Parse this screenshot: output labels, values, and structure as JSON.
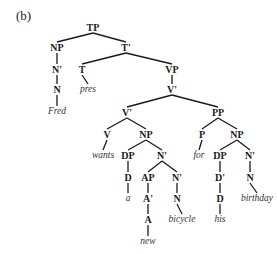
{
  "figure": {
    "panel_label": "(b)"
  },
  "tree": {
    "nodes": [
      {
        "id": "TP",
        "label": "TP",
        "type": "cat",
        "x": 93,
        "y": 28
      },
      {
        "id": "NP1",
        "label": "NP",
        "type": "cat",
        "x": 57,
        "y": 48
      },
      {
        "id": "Tbar",
        "label": "T'",
        "type": "cat",
        "x": 126,
        "y": 48
      },
      {
        "id": "Nbar1",
        "label": "N'",
        "type": "cat",
        "x": 57,
        "y": 70
      },
      {
        "id": "T",
        "label": "T",
        "type": "cat",
        "x": 82,
        "y": 70
      },
      {
        "id": "VP",
        "label": "VP",
        "type": "cat",
        "x": 172,
        "y": 70
      },
      {
        "id": "N1",
        "label": "N",
        "type": "cat",
        "x": 57,
        "y": 90
      },
      {
        "id": "pres",
        "label": "pres",
        "type": "word",
        "x": 88,
        "y": 90
      },
      {
        "id": "Vbar1",
        "label": "V'",
        "type": "cat",
        "x": 172,
        "y": 90
      },
      {
        "id": "Fred",
        "label": "Fred",
        "type": "word",
        "x": 57,
        "y": 112
      },
      {
        "id": "Vbar2",
        "label": "V'",
        "type": "cat",
        "x": 127,
        "y": 113
      },
      {
        "id": "PP",
        "label": "PP",
        "type": "cat",
        "x": 218,
        "y": 113
      },
      {
        "id": "V",
        "label": "V",
        "type": "cat",
        "x": 107,
        "y": 135
      },
      {
        "id": "NP2",
        "label": "NP",
        "type": "cat",
        "x": 146,
        "y": 135
      },
      {
        "id": "P",
        "label": "P",
        "type": "cat",
        "x": 202,
        "y": 135
      },
      {
        "id": "NP3",
        "label": "NP",
        "type": "cat",
        "x": 237,
        "y": 135
      },
      {
        "id": "wants",
        "label": "wants",
        "type": "word",
        "x": 103,
        "y": 156
      },
      {
        "id": "DP1",
        "label": "DP",
        "type": "cat",
        "x": 128,
        "y": 156
      },
      {
        "id": "Nbar2",
        "label": "N'",
        "type": "cat",
        "x": 162,
        "y": 156
      },
      {
        "id": "for",
        "label": "for",
        "type": "word",
        "x": 199,
        "y": 156
      },
      {
        "id": "DP2",
        "label": "DP",
        "type": "cat",
        "x": 220,
        "y": 156
      },
      {
        "id": "Nbar4",
        "label": "N'",
        "type": "cat",
        "x": 250,
        "y": 156
      },
      {
        "id": "D1",
        "label": "D",
        "type": "cat",
        "x": 128,
        "y": 178
      },
      {
        "id": "AP",
        "label": "AP",
        "type": "cat",
        "x": 148,
        "y": 178
      },
      {
        "id": "Nbar3",
        "label": "N'",
        "type": "cat",
        "x": 177,
        "y": 178
      },
      {
        "id": "Dbar",
        "label": "D'",
        "type": "cat",
        "x": 220,
        "y": 178
      },
      {
        "id": "N4",
        "label": "N",
        "type": "cat",
        "x": 250,
        "y": 178
      },
      {
        "id": "a",
        "label": "a",
        "type": "word",
        "x": 128,
        "y": 199
      },
      {
        "id": "Abar",
        "label": "A'",
        "type": "cat",
        "x": 148,
        "y": 199
      },
      {
        "id": "N3",
        "label": "N",
        "type": "cat",
        "x": 177,
        "y": 199
      },
      {
        "id": "D2",
        "label": "D",
        "type": "cat",
        "x": 220,
        "y": 199
      },
      {
        "id": "birthday",
        "label": "birthday",
        "type": "word",
        "x": 257,
        "y": 199
      },
      {
        "id": "A",
        "label": "A",
        "type": "cat",
        "x": 148,
        "y": 220
      },
      {
        "id": "bicycle",
        "label": "bicycle",
        "type": "word",
        "x": 182,
        "y": 220
      },
      {
        "id": "his",
        "label": "his",
        "type": "word",
        "x": 220,
        "y": 220
      },
      {
        "id": "new",
        "label": "new",
        "type": "word",
        "x": 148,
        "y": 242
      }
    ],
    "edges": [
      [
        "TP",
        "NP1"
      ],
      [
        "TP",
        "Tbar"
      ],
      [
        "NP1",
        "Nbar1"
      ],
      [
        "Nbar1",
        "N1"
      ],
      [
        "N1",
        "Fred"
      ],
      [
        "Tbar",
        "T"
      ],
      [
        "Tbar",
        "VP"
      ],
      [
        "T",
        "pres"
      ],
      [
        "VP",
        "Vbar1"
      ],
      [
        "Vbar1",
        "Vbar2"
      ],
      [
        "Vbar1",
        "PP"
      ],
      [
        "Vbar2",
        "V"
      ],
      [
        "Vbar2",
        "NP2"
      ],
      [
        "V",
        "wants"
      ],
      [
        "NP2",
        "DP1"
      ],
      [
        "NP2",
        "Nbar2"
      ],
      [
        "DP1",
        "D1"
      ],
      [
        "D1",
        "a"
      ],
      [
        "Nbar2",
        "AP"
      ],
      [
        "Nbar2",
        "Nbar3"
      ],
      [
        "AP",
        "Abar"
      ],
      [
        "Abar",
        "A"
      ],
      [
        "A",
        "new"
      ],
      [
        "Nbar3",
        "N3"
      ],
      [
        "N3",
        "bicycle"
      ],
      [
        "PP",
        "P"
      ],
      [
        "PP",
        "NP3"
      ],
      [
        "P",
        "for"
      ],
      [
        "NP3",
        "DP2"
      ],
      [
        "NP3",
        "Nbar4"
      ],
      [
        "DP2",
        "Dbar"
      ],
      [
        "Dbar",
        "D2"
      ],
      [
        "D2",
        "his"
      ],
      [
        "Nbar4",
        "N4"
      ],
      [
        "N4",
        "birthday"
      ]
    ]
  }
}
